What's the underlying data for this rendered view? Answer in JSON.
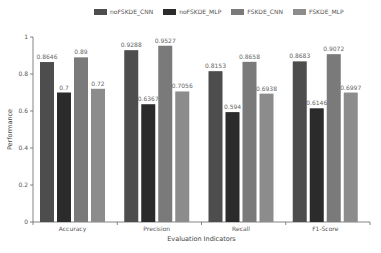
{
  "chart_data": {
    "type": "bar",
    "title": "",
    "xlabel": "Evaluation Indicators",
    "ylabel": "Performance",
    "ylim": [
      0,
      1
    ],
    "yticks": [
      0,
      0.2,
      0.4,
      0.6,
      0.8,
      1
    ],
    "ytick_labels": [
      "0",
      "0.2",
      "0.4",
      "0.6",
      "0.8",
      "1"
    ],
    "grid": false,
    "legend_position": "top",
    "categories": [
      "Accuracy",
      "Precision",
      "Recall",
      "F1-Score"
    ],
    "series": [
      {
        "name": "noFSKDE_CNN",
        "color": "#4d4d4d",
        "values": [
          0.8646,
          0.9288,
          0.8153,
          0.8683
        ],
        "labels": [
          "0.8646",
          "0.9288",
          "0.8153",
          "0.8683"
        ]
      },
      {
        "name": "noFSKDE_MLP",
        "color": "#2b2b2b",
        "values": [
          0.7,
          0.6367,
          0.594,
          0.6146
        ],
        "labels": [
          "0.7",
          "0.6367",
          "0.594",
          "0.6146"
        ]
      },
      {
        "name": "FSKDE_CNN",
        "color": "#7a7a7a",
        "values": [
          0.89,
          0.9527,
          0.8658,
          0.9072
        ],
        "labels": [
          "0.89",
          "0.9527",
          "0.8658",
          "0.9072"
        ]
      },
      {
        "name": "FSKDE_MLP",
        "color": "#8c8c8c",
        "values": [
          0.72,
          0.7056,
          0.6938,
          0.6997
        ],
        "labels": [
          "0.72",
          "0.7056",
          "0.6938",
          "0.6997"
        ]
      }
    ]
  }
}
